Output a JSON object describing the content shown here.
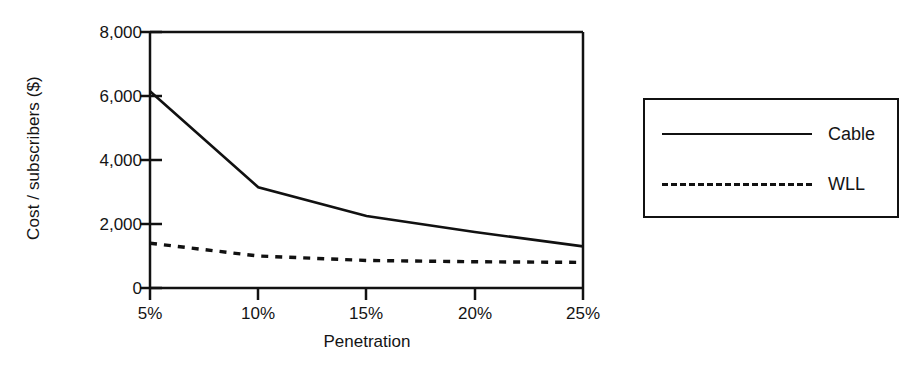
{
  "chart_data": {
    "type": "line",
    "title": "",
    "xlabel": "Penetration",
    "ylabel": "Cost / subscribers ($)",
    "x": [
      5,
      10,
      15,
      20,
      25
    ],
    "categories": [
      "5%",
      "10%",
      "15%",
      "20%",
      "25%"
    ],
    "xtick_labels": [
      "5%",
      "10%",
      "15%",
      "20%",
      "25%"
    ],
    "ytick_labels": [
      "0",
      "2,000",
      "4,000",
      "6,000",
      "8,000"
    ],
    "ytick_values": [
      0,
      2000,
      4000,
      6000,
      8000
    ],
    "xlim": [
      5,
      25
    ],
    "ylim": [
      0,
      8000
    ],
    "grid": false,
    "legend_position": "right-outside",
    "series": [
      {
        "name": "Cable",
        "style": "solid",
        "color": "#111111",
        "values": [
          6150,
          3150,
          2250,
          1750,
          1300
        ]
      },
      {
        "name": "WLL",
        "style": "dotted",
        "color": "#111111",
        "values": [
          1400,
          1000,
          860,
          820,
          800
        ]
      }
    ]
  },
  "axes": {
    "y_title": "Cost / subscribers ($)",
    "x_title": "Penetration",
    "y_labels": [
      "8,000",
      "6,000",
      "4,000",
      "2,000",
      "0"
    ],
    "x_labels": [
      "5%",
      "10%",
      "15%",
      "20%",
      "25%"
    ]
  },
  "legend": {
    "entries": [
      {
        "label": "Cable",
        "style": "solid"
      },
      {
        "label": "WLL",
        "style": "dotted"
      }
    ]
  },
  "colors": {
    "line": "#111111",
    "axis": "#111111",
    "background": "#ffffff"
  }
}
